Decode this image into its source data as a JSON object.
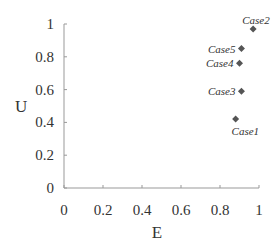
{
  "chart_data": {
    "type": "scatter",
    "title": "",
    "xlabel": "E",
    "ylabel": "U",
    "xlim": [
      0,
      1
    ],
    "ylim": [
      0,
      1
    ],
    "xticks": [
      "0",
      "0.2",
      "0.4",
      "0.6",
      "0.8",
      "1"
    ],
    "yticks": [
      "0",
      "0.2",
      "0.4",
      "0.6",
      "0.8",
      "1"
    ],
    "grid": false,
    "legend": null,
    "marker": "diamond",
    "marker_color": "#555555",
    "points": [
      {
        "label": "Case1",
        "x": 0.88,
        "y": 0.42
      },
      {
        "label": "Case2",
        "x": 0.97,
        "y": 0.97
      },
      {
        "label": "Case3",
        "x": 0.91,
        "y": 0.59
      },
      {
        "label": "Case4",
        "x": 0.9,
        "y": 0.76
      },
      {
        "label": "Case5",
        "x": 0.91,
        "y": 0.85
      }
    ]
  }
}
